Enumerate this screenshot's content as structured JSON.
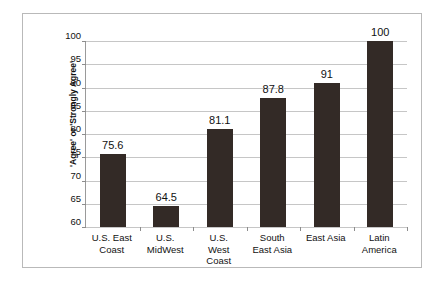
{
  "chart_data": {
    "type": "bar",
    "title": "",
    "xlabel": "",
    "ylabel": "'Agree' or 'Strongly Agree'",
    "ylim": [
      60,
      100
    ],
    "ytick_step": 5,
    "yticks": [
      100,
      95,
      90,
      85,
      80,
      75,
      70,
      65,
      60
    ],
    "grid": true,
    "legend": false,
    "categories": [
      "U.S. East Coast",
      "U.S. MidWest",
      "U.S. West Coast",
      "South East Asia",
      "East Asia",
      "Latin America"
    ],
    "category_lines": [
      [
        "U.S. East",
        "Coast"
      ],
      [
        "U.S.",
        "MidWest"
      ],
      [
        "U.S.",
        "West",
        "Coast"
      ],
      [
        "South",
        "East Asia"
      ],
      [
        "East Asia"
      ],
      [
        "Latin",
        "America"
      ]
    ],
    "values": [
      75.6,
      64.5,
      81.1,
      87.8,
      91,
      100
    ],
    "value_labels": [
      "75.6",
      "64.5",
      "81.1",
      "87.8",
      "91",
      "100"
    ],
    "bar_color": "#332a26",
    "gridline_color": "#c6c6c6",
    "axis_color": "#9a9a9a",
    "frame_color": "#b9b9b9",
    "background_color": "#ffffff"
  }
}
